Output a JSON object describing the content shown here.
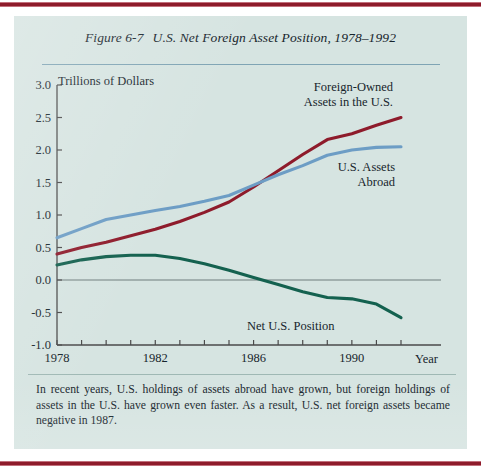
{
  "figure": {
    "number": "Figure 6-7",
    "title": "U.S. Net Foreign Asset Position, 1978–1992",
    "caption": "In recent years, U.S. holdings of assets abroad have grown, but foreign holdings of assets in the U.S. have grown even faster. As a result, U.S. net foreign assets became negative in 1987."
  },
  "theme": {
    "page_background": "#ffffff",
    "panel_background": "#d6e4e1",
    "border_bar": "#8e1b2b",
    "title_rule": "#7fa4b4",
    "text": "#16242c",
    "axis": "#4a4a4a"
  },
  "chart_data": {
    "type": "line",
    "title": "U.S. Net Foreign Asset Position, 1978–1992",
    "xlabel": "Year",
    "ylabel": "Trillions of Dollars",
    "xlim": [
      1978,
      1992
    ],
    "ylim": [
      -1.0,
      3.0
    ],
    "grid": false,
    "zero_line": true,
    "legend": "inline-annotations",
    "x": [
      1978,
      1979,
      1980,
      1981,
      1982,
      1983,
      1984,
      1985,
      1986,
      1987,
      1988,
      1989,
      1990,
      1991,
      1992
    ],
    "xticks": [
      1978,
      1979,
      1980,
      1981,
      1982,
      1983,
      1984,
      1985,
      1986,
      1987,
      1988,
      1989,
      1990,
      1991,
      1992
    ],
    "xtick_labels": [
      "1978",
      "",
      "",
      "",
      "1982",
      "",
      "",
      "",
      "1986",
      "",
      "",
      "",
      "1990",
      "",
      ""
    ],
    "yticks": [
      -1.0,
      -0.5,
      0.0,
      0.5,
      1.0,
      1.5,
      2.0,
      2.5,
      3.0
    ],
    "ytick_labels": [
      "-1.0",
      "-0.5",
      "0.0",
      "0.5",
      "1.0",
      "1.5",
      "2.0",
      "2.5",
      "3.0"
    ],
    "series": [
      {
        "name": "Foreign-Owned Assets in the U.S.",
        "color": "#8e1b2b",
        "label_lines": [
          "Foreign-Owned",
          "Assets in the U.S."
        ],
        "values": [
          0.4,
          0.5,
          0.58,
          0.68,
          0.78,
          0.9,
          1.04,
          1.2,
          1.43,
          1.68,
          1.93,
          2.16,
          2.25,
          2.38,
          2.5
        ]
      },
      {
        "name": "U.S. Assets Abroad",
        "color": "#6d9dc5",
        "label_lines": [
          "U.S. Assets",
          "Abroad"
        ],
        "values": [
          0.65,
          0.79,
          0.93,
          1.0,
          1.07,
          1.13,
          1.21,
          1.3,
          1.46,
          1.62,
          1.76,
          1.92,
          2.0,
          2.04,
          2.05
        ]
      },
      {
        "name": "Net U.S. Position",
        "color": "#14614f",
        "label_lines": [
          "Net U.S. Position"
        ],
        "values": [
          0.23,
          0.31,
          0.36,
          0.38,
          0.38,
          0.33,
          0.25,
          0.15,
          0.04,
          -0.07,
          -0.18,
          -0.27,
          -0.29,
          -0.37,
          -0.58
        ]
      }
    ]
  }
}
